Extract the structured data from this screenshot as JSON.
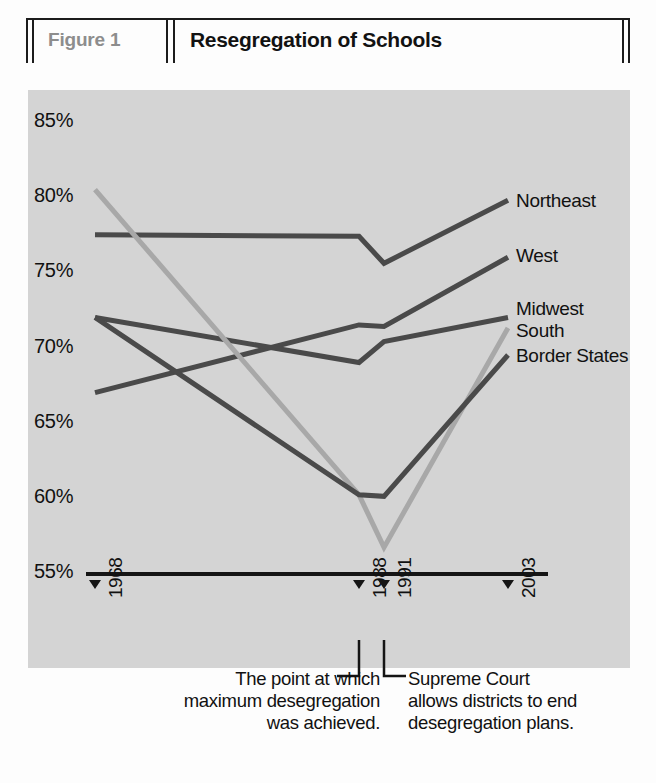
{
  "header": {
    "figure_label": "Figure 1",
    "title": "Resegregation of Schools"
  },
  "colors": {
    "panel_background": "#d4d4d4",
    "page_background": "#fdfdfd",
    "dark_line": "#4a4a4a",
    "light_line": "#a8a8a8",
    "axis": "#151515",
    "text": "#111111",
    "figure_label_gray": "#8d8d8d"
  },
  "annotations": {
    "left": "The point at which\nmaximum desegregation\nwas achieved.",
    "right": "Supreme Court\nallows districts to end\ndesegregation plans."
  },
  "chart_data": {
    "type": "line",
    "title": "Resegregation of Schools",
    "xlabel": "",
    "ylabel": "",
    "grid": false,
    "legend_position": "right-inline",
    "ylim": [
      55,
      85
    ],
    "yticks": [
      85,
      80,
      75,
      70,
      65,
      60,
      55
    ],
    "ytick_labels": [
      "85%",
      "80%",
      "75%",
      "70%",
      "65%",
      "60%",
      "55%"
    ],
    "x": [
      1968,
      1988,
      1991,
      2003
    ],
    "xtick_labels": [
      "1968",
      "1988",
      "1991",
      "2003"
    ],
    "series": [
      {
        "name": "Northeast",
        "color": "#4a4a4a",
        "values": [
          77.5,
          77.4,
          75.6,
          79.8
        ]
      },
      {
        "name": "West",
        "color": "#4a4a4a",
        "values": [
          67.0,
          71.5,
          71.4,
          76.0
        ]
      },
      {
        "name": "Midwest",
        "color": "#4a4a4a",
        "values": [
          72.0,
          69.0,
          70.4,
          72.0
        ]
      },
      {
        "name": "South",
        "color": "#a8a8a8",
        "values": [
          80.5,
          60.2,
          56.7,
          71.3
        ]
      },
      {
        "name": "Border States",
        "color": "#4a4a4a",
        "values": [
          72.0,
          60.2,
          60.1,
          69.5
        ]
      }
    ]
  }
}
